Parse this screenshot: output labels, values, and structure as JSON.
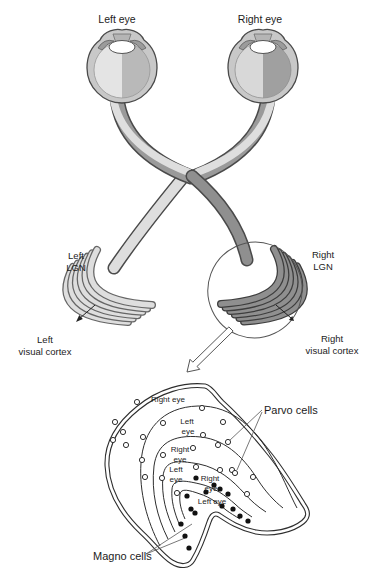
{
  "figure": {
    "eye_labels": {
      "left": "Left eye",
      "right": "Right eye"
    },
    "lgn_labels": {
      "left_line1": "Left",
      "left_line2": "LGN",
      "right_line1": "Right",
      "right_line2": "LGN"
    },
    "cortex_labels": {
      "left_line1": "Left",
      "left_line2": "visual cortex",
      "right_line1": "Right",
      "right_line2": "visual cortex"
    },
    "cell_labels": {
      "parvo": "Parvo cells",
      "magno": "Magno cells"
    }
  },
  "cross_section": {
    "layer_count": 6,
    "layers": [
      {
        "index": 1,
        "eye": "Right eye",
        "cell_type": "parvo",
        "label_line1": "Right eye",
        "label_line2": ""
      },
      {
        "index": 2,
        "eye": "Left eye",
        "cell_type": "parvo",
        "label_line1": "Left",
        "label_line2": "eye"
      },
      {
        "index": 3,
        "eye": "Right eye",
        "cell_type": "parvo",
        "label_line1": "Right",
        "label_line2": "eye"
      },
      {
        "index": 4,
        "eye": "Left eye",
        "cell_type": "parvo",
        "label_line1": "Left",
        "label_line2": "eye"
      },
      {
        "index": 5,
        "eye": "Right eye",
        "cell_type": "magno",
        "label_line1": "Right",
        "label_line2": "eye"
      },
      {
        "index": 6,
        "eye": "Left eye",
        "cell_type": "magno",
        "label_line1": "Left eye",
        "label_line2": ""
      }
    ],
    "parvo_cells_xy": [
      [
        137,
        402
      ],
      [
        163,
        423
      ],
      [
        202,
        408
      ],
      [
        223,
        422
      ],
      [
        115,
        422
      ],
      [
        123,
        432
      ],
      [
        113,
        440
      ],
      [
        126,
        445
      ],
      [
        143,
        437
      ],
      [
        203,
        435
      ],
      [
        218,
        445
      ],
      [
        193,
        448
      ],
      [
        228,
        442
      ],
      [
        163,
        455
      ],
      [
        142,
        460
      ],
      [
        196,
        467
      ],
      [
        220,
        470
      ],
      [
        232,
        470
      ],
      [
        145,
        477
      ],
      [
        162,
        478
      ],
      [
        235,
        473
      ],
      [
        253,
        477
      ],
      [
        177,
        493
      ],
      [
        247,
        494
      ]
    ],
    "magno_cells_xy": [
      [
        196,
        478
      ],
      [
        206,
        492
      ],
      [
        214,
        485
      ],
      [
        220,
        489
      ],
      [
        228,
        494
      ],
      [
        222,
        506
      ],
      [
        233,
        509
      ],
      [
        240,
        516
      ],
      [
        187,
        496
      ],
      [
        191,
        509
      ],
      [
        195,
        513
      ],
      [
        181,
        524
      ],
      [
        185,
        536
      ],
      [
        189,
        548
      ],
      [
        248,
        521
      ]
    ]
  },
  "colors": {
    "light-band": "#dedede",
    "mid-band": "#9a9a9a",
    "dark-band": "#8f8f8f",
    "outline": "#4a4a4a",
    "ink": "#2e2e2e",
    "ball": "#c8c8c8",
    "lens": "#ffffff"
  }
}
